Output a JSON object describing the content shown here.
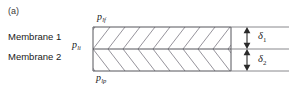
{
  "figure": {
    "panel_label": "(a)",
    "type": "cross-section schematic",
    "layers": [
      {
        "name": "Membrane 1",
        "thickness_symbol": "δ",
        "thickness_subscript": "1"
      },
      {
        "name": "Membrane 2",
        "thickness_symbol": "δ",
        "thickness_subscript": "2"
      }
    ],
    "pressure_labels": [
      {
        "id": "feed",
        "symbol": "p",
        "subscript": "lf",
        "position": "top"
      },
      {
        "id": "interface",
        "symbol": "p",
        "subscript": "li",
        "position": "middle-left"
      },
      {
        "id": "permeate",
        "symbol": "p",
        "subscript": "lp",
        "position": "bottom"
      }
    ],
    "dimensions": [
      {
        "id": "delta-1",
        "symbol": "δ",
        "subscript": "1",
        "layer": "Membrane 1"
      },
      {
        "id": "delta-2",
        "symbol": "δ",
        "subscript": "2",
        "layer": "Membrane 2"
      }
    ],
    "hatching": {
      "pattern": "chevron",
      "top_direction": "down-right",
      "bottom_direction": "up-right",
      "stripe_count": 9
    },
    "colors": {
      "background": "#ffffff",
      "line": "#55545a",
      "hatch": "#8a8790",
      "text": "#1a1a1a"
    },
    "geometry": {
      "box_left": 93,
      "box_right": 231,
      "box_top": 27,
      "box_mid": 49,
      "box_bottom": 71,
      "extension_right": 289,
      "arrow_x": 247
    }
  }
}
